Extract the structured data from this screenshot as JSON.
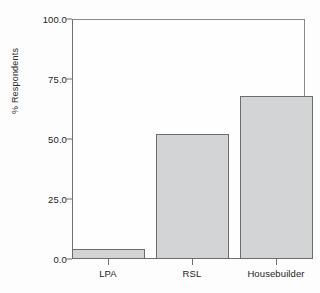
{
  "chart_data": {
    "type": "bar",
    "title": "",
    "subtitle": "",
    "xlabel": "",
    "ylabel": "% Respondents",
    "categories": [
      "LPA",
      "RSL",
      "Housebuilder"
    ],
    "values": [
      4.2,
      52.0,
      68.0
    ],
    "series": [
      {
        "name": "% Respondents",
        "values": [
          4.2,
          52.0,
          68.0
        ]
      }
    ],
    "ylim": [
      0.0,
      100.0
    ],
    "ytick_labels": [
      "100.0",
      "75.0",
      "50.0",
      "25.0",
      "0.0"
    ],
    "ytick_values": [
      100.0,
      75.0,
      50.0,
      25.0,
      0.0
    ],
    "grid": false,
    "legend": null,
    "legend_position": "none",
    "annotations": [],
    "colors": {
      "bar_fill": "#d2d4d5",
      "bar_border": "#6a6c6e",
      "axis": "#6e6e6e",
      "frame": "#8a8a8a",
      "text": "#1c1c1c",
      "background": "#fdfdfd"
    }
  }
}
